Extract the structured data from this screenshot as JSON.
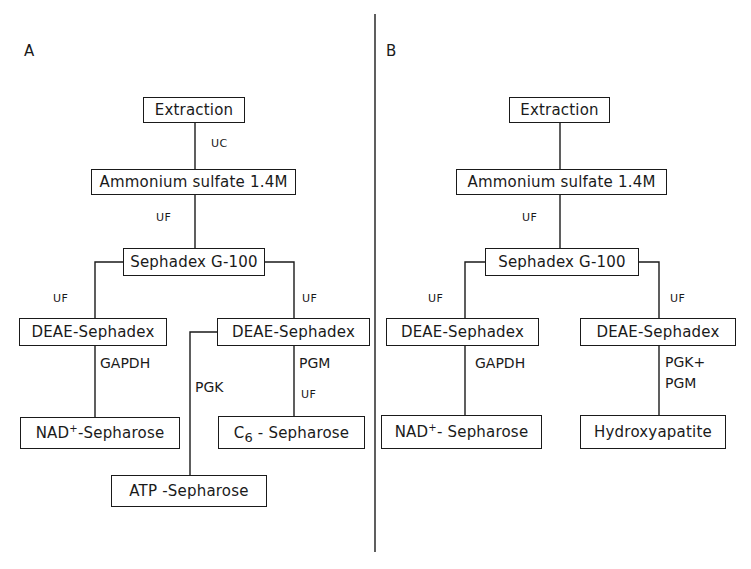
{
  "panels": {
    "a": {
      "letter": "A",
      "boxes": {
        "extraction": "Extraction",
        "ammonium": "Ammonium sulfate 1.4M",
        "sephadex": "Sephadex G-100",
        "deae_left": "DEAE-Sephadex",
        "deae_right": "DEAE-Sephadex",
        "nad_prefix": "NAD",
        "nad_sup": "+",
        "nad_suffix": "-Sepharose",
        "c6_prefix": "C",
        "c6_sub": "6",
        "c6_suffix": " - Sepharose",
        "atp": "ATP -Sepharose"
      },
      "labels": {
        "uc": "UC",
        "uf_main": "UF",
        "uf_left": "UF",
        "uf_right": "UF",
        "gapdh": "GAPDH",
        "pgk": "PGK",
        "pgm": "PGM",
        "uf_pgm": "UF"
      }
    },
    "b": {
      "letter": "B",
      "boxes": {
        "extraction": "Extraction",
        "ammonium": "Ammonium sulfate 1.4M",
        "sephadex": "Sephadex G-100",
        "deae_left": "DEAE-Sephadex",
        "deae_right": "DEAE-Sephadex",
        "nad_prefix": "NAD",
        "nad_sup": "+",
        "nad_suffix": "- Sepharose",
        "hydroxyapatite": "Hydroxyapatite"
      },
      "labels": {
        "uf_main": "UF",
        "uf_left": "UF",
        "uf_right": "UF",
        "gapdh": "GAPDH",
        "pgk_pgm_line1": "PGK+",
        "pgk_pgm_line2": "PGM"
      }
    }
  }
}
